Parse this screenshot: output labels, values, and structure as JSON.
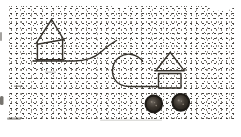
{
  "figure": {
    "kind": "stipple-engraving-illustration",
    "objects": [
      {
        "name": "house-sledge",
        "parts": [
          "gabled-house-body",
          "slanted-top-line",
          "curved-runner"
        ]
      },
      {
        "name": "house-cart",
        "parts": [
          "gabled-house-body",
          "roof-overhang-line",
          "curved-draft-pole",
          "left-wheel",
          "right-wheel"
        ]
      }
    ],
    "colors": {
      "paper": "#ffffff",
      "ink": "#35312b",
      "stipple": "#5a564f",
      "smudge": "#4a463f",
      "wheel_rim": "#1d1a16",
      "wheel_mid": "#3a342d",
      "wheel_light": "#6b645c"
    }
  }
}
